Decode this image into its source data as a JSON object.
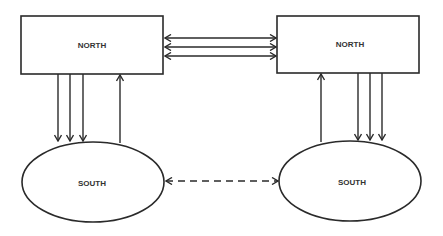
{
  "diagram": {
    "nodes": [
      {
        "id": "north-left",
        "shape": "rectangle",
        "label": "NORTH"
      },
      {
        "id": "north-right",
        "shape": "rectangle",
        "label": "NORTH"
      },
      {
        "id": "south-left",
        "shape": "ellipse",
        "label": "SOUTH"
      },
      {
        "id": "south-right",
        "shape": "ellipse",
        "label": "SOUTH"
      }
    ],
    "edges": [
      {
        "from": "north-left",
        "to": "north-right",
        "count": 3,
        "direction": "bidirectional",
        "style": "solid"
      },
      {
        "from": "north-left",
        "to": "south-left",
        "count": 3,
        "direction": "forward",
        "style": "solid"
      },
      {
        "from": "south-left",
        "to": "north-left",
        "count": 1,
        "direction": "forward",
        "style": "solid"
      },
      {
        "from": "north-right",
        "to": "south-right",
        "count": 3,
        "direction": "forward",
        "style": "solid"
      },
      {
        "from": "south-right",
        "to": "north-right",
        "count": 1,
        "direction": "forward",
        "style": "solid"
      },
      {
        "from": "south-left",
        "to": "south-right",
        "count": 1,
        "direction": "bidirectional",
        "style": "dashed"
      }
    ],
    "colors": {
      "stroke": "#2a2a2a",
      "text": "#333333",
      "background": "#ffffff"
    }
  }
}
